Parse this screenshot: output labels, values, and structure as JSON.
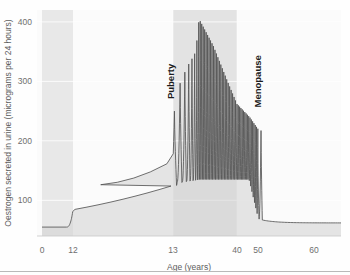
{
  "chart_data": {
    "type": "area",
    "title": "",
    "xlabel": "Age (years)",
    "ylabel": "Oestrogen secreted in urine (micrograms per 24 hours)",
    "ylim": [
      40,
      420
    ],
    "xlim": [
      0,
      64
    ],
    "yticks": [
      100,
      200,
      300,
      400
    ],
    "xticks": [
      0,
      12,
      13,
      40,
      50,
      60
    ],
    "grid": true,
    "legend_position": "none",
    "annotations": [
      {
        "text": "Puberty",
        "x": 13.5,
        "y": 300,
        "orientation": "vertical"
      },
      {
        "text": "Menopause",
        "x": 50.5,
        "y": 300,
        "orientation": "vertical"
      }
    ],
    "bands": [
      {
        "name": "childhood",
        "x_start": 0,
        "x_end": 12,
        "color": "#d8d8d8"
      },
      {
        "name": "reproductive-years",
        "x_start": 13,
        "x_end": 40,
        "color": "#cfcfcf"
      }
    ],
    "series": [
      {
        "name": "Oestrogen",
        "line_color": "#555555",
        "fill_color": "#d5d5d5",
        "baseline": 55,
        "description": "Flat low childhood level, rising menstrual-cycle oscillations through puberty, sustained high-frequency cycling through reproductive years peaking ~405 at age 24, declining amplitude to menopause, final peak ~215 at age 51, then decay to ~60",
        "cycles": [
          {
            "age": 13.6,
            "peak": 250,
            "trough": 125
          },
          {
            "age": 16.0,
            "peak": 297,
            "trough": 130
          },
          {
            "age": 19.0,
            "peak": 325,
            "trough": 132
          },
          {
            "age": 21.0,
            "peak": 338,
            "trough": 133
          },
          {
            "age": 22.6,
            "peak": 350,
            "trough": 134
          },
          {
            "age": 24.0,
            "peak": 405,
            "trough": 135
          },
          {
            "age": 30.0,
            "peak": 360,
            "trough": 135
          },
          {
            "age": 36.0,
            "peak": 300,
            "trough": 135
          },
          {
            "age": 40.0,
            "peak": 262,
            "trough": 135
          },
          {
            "age": 46.0,
            "peak": 240,
            "trough": 135
          },
          {
            "age": 51.0,
            "peak": 215,
            "trough": 60
          }
        ],
        "endpoints": [
          {
            "age": 0,
            "value": 55
          },
          {
            "age": 10,
            "value": 56
          },
          {
            "age": 12,
            "value": 80
          },
          {
            "age": 60,
            "value": 62
          },
          {
            "age": 64,
            "value": 62
          }
        ]
      }
    ]
  }
}
